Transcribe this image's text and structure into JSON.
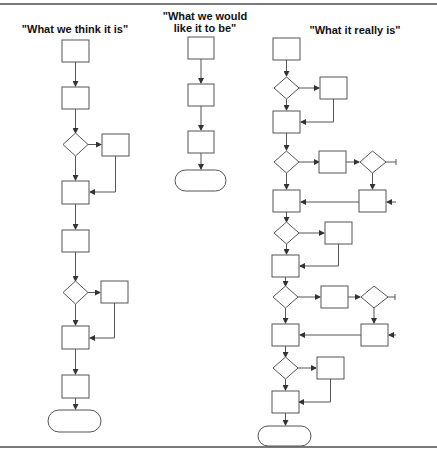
{
  "columns": [
    {
      "title": "\"What we think it is\""
    },
    {
      "title": "\"What we would\nlike it to be\""
    },
    {
      "title": "\"What it really is\""
    }
  ],
  "colors": {
    "stroke": "#555555",
    "text": "#111111",
    "rule": "#7a7a7a"
  }
}
